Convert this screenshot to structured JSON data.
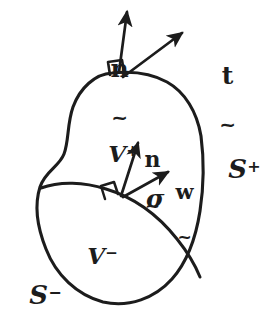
{
  "figure": {
    "background_color": "#ffffff",
    "ink_color": "#1c1c1c",
    "stroke_width_outline": 3.1,
    "stroke_width_arrow": 2.6,
    "width": 260,
    "height": 323
  },
  "labels": {
    "normal_outer": {
      "glyph": "n",
      "under": "~",
      "name": "unit normal to outer boundary"
    },
    "traction_outer": {
      "glyph": "t",
      "under": "~",
      "name": "traction vector on outer boundary"
    },
    "normal_inner": {
      "glyph": "n",
      "under": "~",
      "name": "unit normal to singular surface"
    },
    "velocity_inner": {
      "glyph": "w",
      "under": "~",
      "name": "propagation velocity of singular surface"
    },
    "sigma": {
      "glyph": "σ",
      "name": "singular surface sigma"
    },
    "region_plus": {
      "base": "V",
      "sup": "+",
      "name": "volume region plus"
    },
    "region_minus": {
      "base": "V",
      "sup": "−",
      "name": "volume region minus"
    },
    "surface_plus": {
      "base": "S",
      "sup": "+",
      "name": "bounding surface plus"
    },
    "surface_minus": {
      "base": "S",
      "sup": "−",
      "name": "bounding surface minus"
    }
  },
  "geometry": {
    "outer_blob_path": "M 112 73 C 92 75 76 92 70 112 C 65 130 68 146 63 158 C 58 170 44 174 40 189 C 35 206 38 228 45 248 C 54 274 75 294 101 301 C 127 308 153 299 171 281 C 188 263 196 238 200 212 C 204 186 205 160 202 137 C 198 113 186 93 168 82 C 152 73 131 71 112 73 Z",
    "sigma_curve_path": "M 41 190 C 62 183 88 184 110 191 C 136 199 160 216 179 240 C 190 254 197 268 200 279",
    "normal_outer_arrow": {
      "x1": 120,
      "y1": 74,
      "x2": 128,
      "y2": 9
    },
    "traction_outer_arrow": {
      "x1": 124,
      "y1": 78,
      "x2": 186,
      "y2": 31
    },
    "normal_inner_arrow": {
      "x1": 122,
      "y1": 196,
      "x2": 140,
      "y2": 140
    },
    "velocity_inner_arrow": {
      "x1": 124,
      "y1": 197,
      "x2": 172,
      "y2": 170
    },
    "right_angle_marker_outer": {
      "x": 111,
      "y": 62,
      "size": 13
    },
    "right_angle_marker_inner": {
      "x": 104,
      "y": 186,
      "size": 13
    }
  }
}
